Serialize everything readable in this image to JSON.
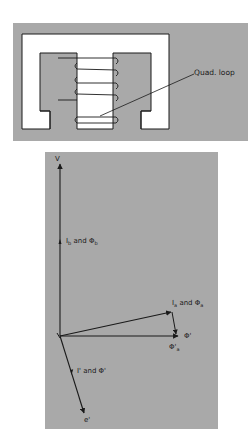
{
  "figure": {
    "colors": {
      "background": "#ffffff",
      "panel_gray": "#a9a9a9",
      "core_white": "#ffffff",
      "ink": "#1a1a1a"
    },
    "core_diagram": {
      "label": "Quad. loop"
    },
    "phasor_diagram": {
      "labels": {
        "voltage": "V",
        "ib_phib": "I",
        "ib_phib_sub": "b",
        "ib_phib_and": " and Φ",
        "ib_phib_sub2": "b",
        "ia_phia": "I",
        "ia_phia_sub": "a",
        "ia_phia_and": " and Φ",
        "ia_phia_sub2": "a",
        "phi_prime": "Φ'",
        "phi_a_prime": "Φ'",
        "phi_a_prime_sub": "a",
        "i_prime": "I' and Φ'",
        "e_prime": "e'"
      }
    }
  }
}
